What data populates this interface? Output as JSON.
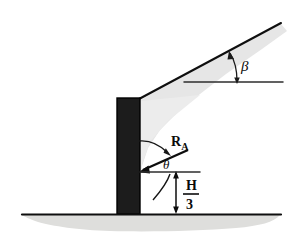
{
  "figure": {
    "name": "retaining-wall-free-body-diagram",
    "background_color": "#ffffff",
    "width": 295,
    "height": 240,
    "labels": {
      "beta": "β",
      "theta": "θ",
      "resultant_force": "R",
      "resultant_force_subscript": "A",
      "height_numerator": "H",
      "height_denominator": "3"
    },
    "colors": {
      "wall_fill": "#1c1c1c",
      "wall_outline": "#000000",
      "line": "#111111",
      "backfill_shade": "#e2e2e2",
      "ground_shade": "#dededc",
      "ground_line": "#111111",
      "reference_line": "#3a3a3a"
    },
    "geometry": {
      "wall_left": 117,
      "wall_right": 140,
      "wall_top": 98,
      "wall_bottom": 214,
      "ground_y": 214,
      "slope_top_x": 281,
      "slope_top_y": 23,
      "beta_ref_line_y": 82,
      "beta_ref_line_x1": 184,
      "beta_ref_line_x2": 283,
      "force_tip_x": 139,
      "force_tip_y": 172,
      "force_tail_x": 189,
      "force_tail_y": 150,
      "dimension_x": 176,
      "dimension_top_y": 172,
      "dimension_bottom_y": 213
    }
  }
}
